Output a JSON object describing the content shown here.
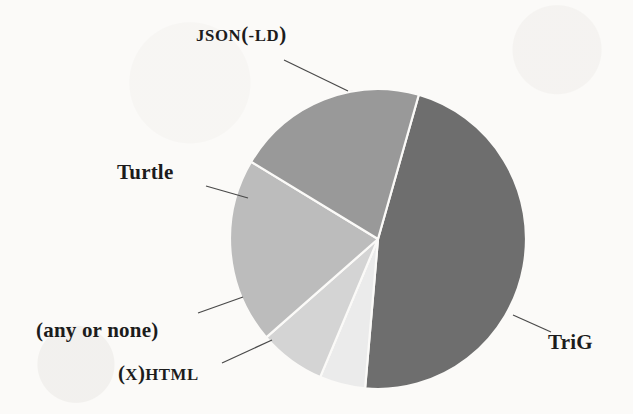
{
  "chart_data": {
    "type": "pie",
    "title": "",
    "legend_position": "callout-labels",
    "grid": false,
    "background_color": "#fbfaf8",
    "center": {
      "x": 378,
      "y": 239
    },
    "radius": {
      "rx": 148,
      "ry": 150
    },
    "start_angle_deg": -74,
    "direction": "clockwise",
    "categories": [
      "TriG",
      "(X)HTML",
      "(any or none)",
      "Turtle",
      "JSON(-LD)"
    ],
    "values": [
      47,
      5,
      7,
      20,
      21
    ],
    "slices": [
      {
        "name": "TriG",
        "label": "TriG",
        "value": 47,
        "color": "#6e6e6e",
        "start_angle_deg": -74,
        "end_angle_deg": 95,
        "label_position": "right"
      },
      {
        "name": "(X)HTML",
        "label": "(X)HTML",
        "value": 5,
        "color": "#ebebeb",
        "start_angle_deg": 95,
        "end_angle_deg": 113,
        "label_position": "bottom-left"
      },
      {
        "name": "(any or none)",
        "label": "(any or none)",
        "value": 7,
        "color": "#d4d4d4",
        "start_angle_deg": 113,
        "end_angle_deg": 139,
        "label_position": "left-lower"
      },
      {
        "name": "Turtle",
        "label": "Turtle",
        "value": 20,
        "color": "#bcbcbc",
        "start_angle_deg": 139,
        "end_angle_deg": 211,
        "label_position": "left-upper"
      },
      {
        "name": "JSON(-LD)",
        "label": "JSON(-LD)",
        "value": 21,
        "color": "#999999",
        "start_angle_deg": 211,
        "end_angle_deg": 286,
        "label_position": "top"
      }
    ]
  },
  "labels": {
    "json_ld": {
      "acronym_1": "JSON",
      "paren_open": "(",
      "dash": "-",
      "acronym_2": "LD",
      "paren_close": ")"
    },
    "turtle": "Turtle",
    "any_or_none": "(any or none)",
    "xhtml": {
      "paren_open": "(",
      "acronym_x": "X",
      "paren_close": ")",
      "acronym_html": "HTML"
    },
    "trig": "TriG"
  },
  "leader_lines": [
    {
      "name": "json-ld",
      "x1": 284,
      "y1": 60,
      "x2": 348,
      "y2": 91
    },
    {
      "name": "turtle",
      "x1": 206,
      "y1": 186,
      "x2": 248,
      "y2": 198
    },
    {
      "name": "any-or-none",
      "x1": 198,
      "y1": 313,
      "x2": 243,
      "y2": 297
    },
    {
      "name": "xhtml",
      "x1": 222,
      "y1": 363,
      "x2": 272,
      "y2": 340
    },
    {
      "name": "trig",
      "x1": 513,
      "y1": 315,
      "x2": 551,
      "y2": 332
    }
  ]
}
